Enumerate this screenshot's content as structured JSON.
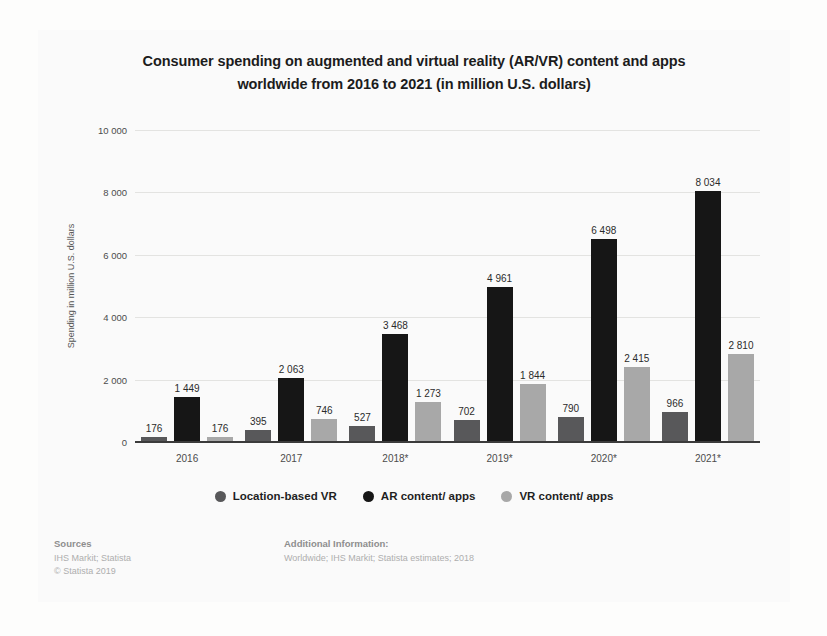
{
  "background_page": {
    "ghost_left": "",
    "ghost_right": "",
    "ghost_top": "",
    "ghost_bottom": ""
  },
  "chart_data": {
    "type": "bar",
    "title": "Consumer spending on augmented and virtual reality (AR/VR) content and apps worldwide from 2016 to 2021 (in million U.S. dollars)",
    "title_line1": "Consumer spending on augmented and virtual reality (AR/VR) content and apps",
    "title_line2": "worldwide from 2016 to 2021 (in million U.S. dollars)",
    "xlabel": "",
    "ylabel": "Spending in million U.S. dollars",
    "ylim": [
      0,
      10000
    ],
    "ytick_values": [
      0,
      2000,
      4000,
      6000,
      8000,
      10000
    ],
    "ytick_labels": [
      "0",
      "2 000",
      "4 000",
      "6 000",
      "8 000",
      "10 000"
    ],
    "grid": true,
    "legend_position": "bottom",
    "categories": [
      "2016",
      "2017",
      "2018*",
      "2019*",
      "2020*",
      "2021*"
    ],
    "series": [
      {
        "name": "Location-based VR",
        "color": "#58585a",
        "values": [
          176,
          395,
          527,
          702,
          790,
          966
        ],
        "labels": [
          "176",
          "395",
          "527",
          "702",
          "790",
          "966"
        ]
      },
      {
        "name": "AR content/ apps",
        "color": "#161616",
        "values": [
          1449,
          2063,
          3468,
          4961,
          6498,
          8034
        ],
        "labels": [
          "1 449",
          "2 063",
          "3 468",
          "4 961",
          "6 498",
          "8 034"
        ]
      },
      {
        "name": "VR content/ apps",
        "color": "#a8a8a8",
        "values": [
          176,
          746,
          1273,
          1844,
          2415,
          2810
        ],
        "labels": [
          "176",
          "746",
          "1 273",
          "1 844",
          "2 415",
          "2 810"
        ]
      }
    ]
  },
  "footer": {
    "sources_heading": "Sources",
    "sources_line1": "IHS Markit; Statista",
    "sources_line2": "© Statista 2019",
    "additional_heading": "Additional Information:",
    "additional_line1": "Worldwide; IHS Markit; Statista estimates; 2018"
  }
}
